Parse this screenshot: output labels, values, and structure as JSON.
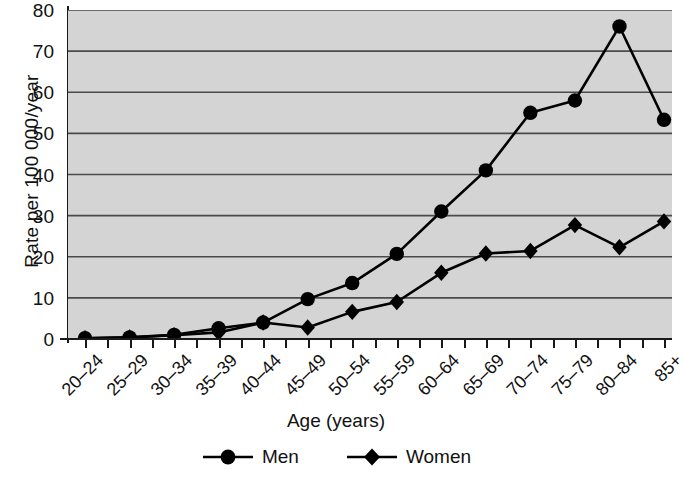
{
  "chart_data": {
    "type": "line",
    "title": "",
    "xlabel": "Age (years)",
    "ylabel": "Rate per 100 000/year",
    "categories": [
      "20–24",
      "25–29",
      "30–34",
      "35–39",
      "40–44",
      "45–49",
      "50–54",
      "55–59",
      "60–64",
      "65–69",
      "70–74",
      "75–79",
      "80–84",
      "85+"
    ],
    "series": [
      {
        "name": "Men",
        "marker": "circle",
        "color": "#000000",
        "values": [
          0.2,
          0.4,
          1.0,
          2.6,
          4.0,
          9.7,
          13.6,
          20.7,
          31.0,
          41.0,
          55.0,
          58.0,
          76.0,
          53.3
        ]
      },
      {
        "name": "Women",
        "marker": "diamond",
        "color": "#000000",
        "values": [
          0.2,
          0.4,
          0.9,
          1.6,
          4.0,
          2.8,
          6.6,
          9.0,
          16.1,
          20.8,
          21.4,
          27.7,
          22.3,
          28.6
        ]
      }
    ],
    "ylim": [
      0,
      80
    ],
    "y_ticks": [
      0,
      10,
      20,
      30,
      40,
      50,
      60,
      70,
      80
    ],
    "y_tick_labels": [
      "0",
      "10",
      "20",
      "30",
      "40",
      "50",
      "60",
      "70",
      "80"
    ],
    "grid": true,
    "grid_axis": "y",
    "legend_position": "bottom",
    "plot_background": "#d4d4d4",
    "gridline_color": "#4a4a4a",
    "axis_color": "#1a1a1a"
  },
  "legend": {
    "items": [
      {
        "label": "Men",
        "marker": "circle-marker-icon"
      },
      {
        "label": "Women",
        "marker": "diamond-marker-icon"
      }
    ]
  }
}
